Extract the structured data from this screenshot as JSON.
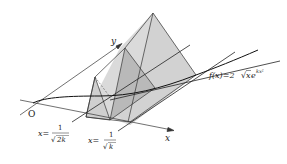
{
  "diagram": {
    "axes": {
      "x_label": "x",
      "y_label": "y",
      "origin_label": "O"
    },
    "function_label": {
      "prefix": "f(x)=2",
      "sqrt_arg": "x",
      "base": "e",
      "exponent": "kx²"
    },
    "cut_label_1": {
      "lhs": "x=",
      "numerator": "1",
      "denominator": "2k"
    },
    "cut_label_2": {
      "lhs": "x=",
      "numerator": "1",
      "denominator": "k"
    },
    "colors": {
      "solid_fill": "#d4d4d4",
      "section_fill": "#b8b8b8",
      "line": "#2a2a2a"
    }
  }
}
